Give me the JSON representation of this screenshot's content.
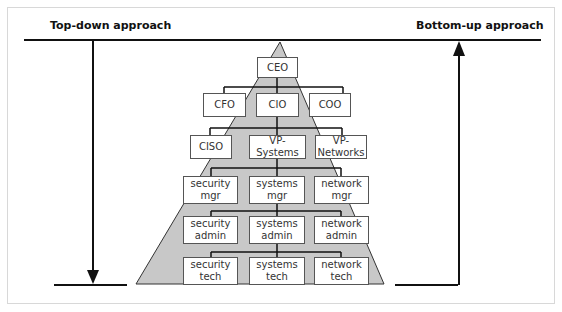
{
  "labels": {
    "top_down": "Top-down approach",
    "bottom_up": "Bottom-up approach"
  },
  "colors": {
    "pyramid_fill": "#c8c8c8",
    "line": "#111111",
    "box_border": "#555555"
  },
  "nodes": {
    "ceo": "CEO",
    "cfo": "CFO",
    "cio": "CIO",
    "coo": "COO",
    "ciso": "CISO",
    "vp_systems": "VP-Systems",
    "vp_networks": "VP-Networks",
    "security_mgr": "security\nmgr",
    "systems_mgr": "systems\nmgr",
    "network_mgr": "network\nmgr",
    "security_admin": "security\nadmin",
    "systems_admin": "systems\nadmin",
    "network_admin": "network\nadmin",
    "security_tech": "security\ntech",
    "systems_tech": "systems\ntech",
    "network_tech": "network\ntech"
  }
}
